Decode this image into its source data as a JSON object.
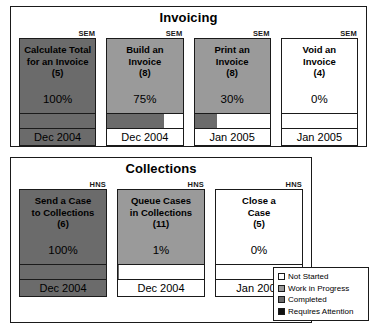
{
  "panels": [
    {
      "id": "invoicing",
      "title": "Invoicing",
      "cards": [
        {
          "tag": "SEM",
          "name": "Calculate Total\nfor an Invoice",
          "count": "(5)",
          "percent_label": "100%",
          "percent_value": 100,
          "date": "Dec 2004",
          "state": "completed"
        },
        {
          "tag": "SEM",
          "name": "Build an\nInvoice",
          "count": "(8)",
          "percent_label": "75%",
          "percent_value": 75,
          "date": "Dec 2004",
          "state": "wip"
        },
        {
          "tag": "SEM",
          "name": "Print an\nInvoice",
          "count": "(8)",
          "percent_label": "30%",
          "percent_value": 30,
          "date": "Jan 2005",
          "state": "wip"
        },
        {
          "tag": "SEM",
          "name": "Void an\nInvoice",
          "count": "(4)",
          "percent_label": "0%",
          "percent_value": 0,
          "date": "Jan 2005",
          "state": "notstarted"
        }
      ]
    },
    {
      "id": "collections",
      "title": "Collections",
      "cards": [
        {
          "tag": "HNS",
          "name": "Send a Case\nto Collections",
          "count": "(6)",
          "percent_label": "100%",
          "percent_value": 100,
          "date": "Dec 2004",
          "state": "completed"
        },
        {
          "tag": "HNS",
          "name": "Queue Cases\nin Collections",
          "count": "(11)",
          "percent_label": "1%",
          "percent_value": 1,
          "date": "Dec 2004",
          "state": "wip"
        },
        {
          "tag": "HNS",
          "name": "Close a\nCase",
          "count": "(5)",
          "percent_label": "0%",
          "percent_value": 0,
          "date": "Jan 2005",
          "state": "notstarted"
        }
      ]
    }
  ],
  "legend": {
    "items": [
      {
        "label": "Not Started",
        "color": "#ffffff"
      },
      {
        "label": "Work in Progress",
        "color": "#9a9a9a"
      },
      {
        "label": "Completed",
        "color": "#6b6b6b"
      },
      {
        "label": "Requires Attention",
        "color": "#111111"
      }
    ]
  }
}
